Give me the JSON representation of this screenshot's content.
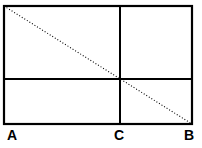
{
  "figure": {
    "background_color": "#ffffff",
    "stroke_color": "#000000",
    "canvas": {
      "width": 202,
      "height": 148
    },
    "rectangle": {
      "name": "outer-rectangle",
      "x": 4,
      "y": 6,
      "width": 188,
      "height": 118,
      "stroke_width": 2.2
    },
    "dividers": [
      {
        "name": "vertical-divider",
        "orientation": "vertical",
        "x": 120,
        "y1": 6,
        "y2": 124,
        "stroke_width": 2.0
      },
      {
        "name": "horizontal-divider",
        "orientation": "horizontal",
        "y": 79,
        "x1": 4,
        "x2": 192,
        "stroke_width": 2.0
      }
    ],
    "diagonal": {
      "name": "dotted-diagonal",
      "style": "dotted",
      "x1": 4,
      "y1": 6,
      "x2": 192,
      "y2": 124,
      "stroke_width": 1.1,
      "dash_pattern": "1,2"
    },
    "labels": [
      {
        "id": "A",
        "text": "A",
        "x": 7,
        "y": 128
      },
      {
        "id": "C",
        "text": "C",
        "x": 114,
        "y": 128
      },
      {
        "id": "B",
        "text": "B",
        "x": 184,
        "y": 128
      }
    ]
  }
}
